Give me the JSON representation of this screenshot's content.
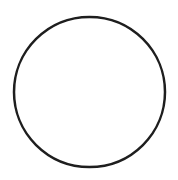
{
  "image": {
    "kind": "line-drawing",
    "width": 178,
    "height": 180,
    "background_color": "#ffffff",
    "caption_top": "",
    "caption_bottom": ""
  },
  "chart_data": {
    "type": "scatter",
    "title": "",
    "subtitle": "",
    "xlabel": "",
    "ylabel": "",
    "grid": false,
    "legend": [],
    "annotations": [],
    "xlim": [
      0,
      178
    ],
    "ylim": [
      0,
      180
    ],
    "shapes": [
      {
        "name": "circle-outline",
        "type": "circle",
        "cx": 89.5,
        "cy": 92,
        "r": 75,
        "rx": 75.5,
        "ry": 75,
        "stroke_color": "#1e1e1e",
        "stroke_width": 2.5,
        "fill": "none",
        "bounds": {
          "left": 14,
          "top": 17,
          "right": 165,
          "bottom": 167
        }
      }
    ]
  }
}
